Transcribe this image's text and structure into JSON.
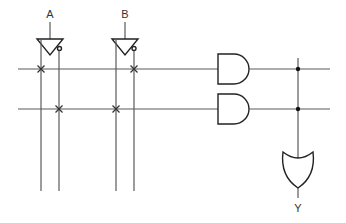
{
  "diagram": {
    "type": "logic-circuit",
    "inputs": [
      {
        "label": "A",
        "x": 50
      },
      {
        "label": "B",
        "x": 125
      }
    ],
    "output": {
      "label": "Y"
    },
    "gates": [
      {
        "id": "buf-A",
        "kind": "buffer-inverter",
        "input": "A"
      },
      {
        "id": "buf-B",
        "kind": "buffer-inverter",
        "input": "B"
      },
      {
        "id": "and-1",
        "kind": "AND",
        "terms": [
          "A",
          "B'"
        ]
      },
      {
        "id": "and-2",
        "kind": "AND",
        "terms": [
          "A'",
          "B"
        ]
      },
      {
        "id": "or-1",
        "kind": "OR",
        "inputs": [
          "and-1",
          "and-2"
        ],
        "output": "Y"
      }
    ],
    "product_lines": [
      {
        "y": 69,
        "connections": [
          {
            "column": "A",
            "x": 41
          },
          {
            "column": "B'",
            "x": 133
          }
        ]
      },
      {
        "y": 109,
        "connections": [
          {
            "column": "A'",
            "x": 59
          },
          {
            "column": "B",
            "x": 116
          }
        ]
      }
    ],
    "colors": {
      "wire": "#5a5a5a",
      "gate": "#222222",
      "background": "#ffffff"
    }
  }
}
